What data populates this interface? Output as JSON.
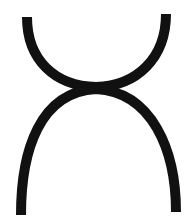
{
  "symbol": {
    "name": "upper-cup-and-lower-arch-symbol",
    "description": "A U-shaped arc touching an inverted U-shaped arch at a single point",
    "stroke_color": "#111111",
    "background_color": "#ffffff",
    "stroke_width": 10
  }
}
